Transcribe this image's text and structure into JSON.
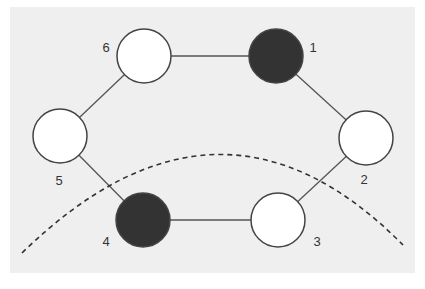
{
  "diagram": {
    "type": "ring-graph",
    "background": "#efefef",
    "edge_color": "#555555",
    "node_fill_white": "#ffffff",
    "node_fill_dark": "#333333",
    "node_stroke": "#444444",
    "nodes": [
      {
        "id": "1",
        "label": "1",
        "filled": true,
        "cx": 276,
        "cy": 56,
        "lx": 313,
        "ly": 52
      },
      {
        "id": "2",
        "label": "2",
        "filled": false,
        "cx": 366,
        "cy": 138,
        "lx": 364,
        "ly": 184
      },
      {
        "id": "3",
        "label": "3",
        "filled": false,
        "cx": 278,
        "cy": 220,
        "lx": 317,
        "ly": 246
      },
      {
        "id": "4",
        "label": "4",
        "filled": true,
        "cx": 143,
        "cy": 220,
        "lx": 106,
        "ly": 246
      },
      {
        "id": "5",
        "label": "5",
        "filled": false,
        "cx": 60,
        "cy": 136,
        "lx": 59,
        "ly": 185
      },
      {
        "id": "6",
        "label": "6",
        "filled": false,
        "cx": 144,
        "cy": 56,
        "lx": 106,
        "ly": 52
      }
    ],
    "edges": [
      [
        "6",
        "1"
      ],
      [
        "1",
        "2"
      ],
      [
        "2",
        "3"
      ],
      [
        "3",
        "4"
      ],
      [
        "4",
        "5"
      ],
      [
        "5",
        "6"
      ]
    ],
    "arc": {
      "style": "dashed",
      "from": [
        22,
        253
      ],
      "control": [
        220,
        60
      ],
      "to": [
        403,
        245
      ]
    }
  }
}
